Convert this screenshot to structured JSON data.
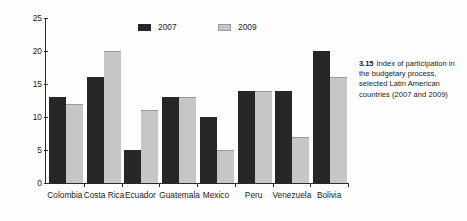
{
  "figure": {
    "caption_number": "3.15",
    "caption_text": "Index of participation in the budgetary process, selected Latin American countries (2007 and 2009)"
  },
  "colors": {
    "series_2007": "#262626",
    "series_2009": "#c6c6c6",
    "axis": "#2b2b2b",
    "background": "#fdfdfd"
  },
  "chart_data": {
    "type": "bar",
    "title": "",
    "subtitle": "",
    "xlabel": "",
    "ylabel": "100 = maximum participation",
    "ylim": [
      0,
      25
    ],
    "yticks": [
      0,
      5,
      10,
      15,
      20,
      25
    ],
    "ytick_labels": [
      "0",
      "5",
      "10",
      "15",
      "20",
      "25"
    ],
    "grid": false,
    "legend_position": "top-center",
    "categories": [
      "Colombia",
      "Costa Rica",
      "Ecuador",
      "Guatemala",
      "Mexico",
      "Peru",
      "Venezuela",
      "Bolivia"
    ],
    "series": [
      {
        "name": "2007",
        "color": "#262626",
        "values": [
          13,
          16,
          5,
          13,
          10,
          14,
          14,
          20
        ]
      },
      {
        "name": "2009",
        "color": "#c6c6c6",
        "values": [
          12,
          20,
          11,
          13,
          5,
          14,
          7,
          16
        ]
      }
    ]
  }
}
